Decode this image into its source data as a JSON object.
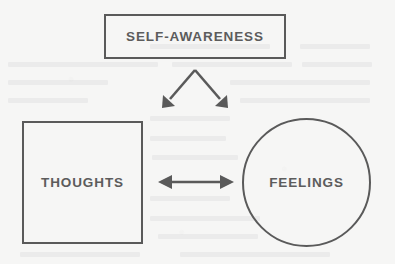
{
  "diagram": {
    "background_color": "#f6f6f5",
    "ink_color": "#5a5a5a",
    "text_color": "#5c5c5c",
    "nodes": [
      {
        "id": "self-awareness",
        "label": "SELF-AWARENESS",
        "shape": "rectangle"
      },
      {
        "id": "thoughts",
        "label": "THOUGHTS",
        "shape": "square"
      },
      {
        "id": "feelings",
        "label": "FEELINGS",
        "shape": "circle"
      }
    ],
    "connectors": [
      {
        "id": "branch-arrow",
        "from": "self-awareness",
        "to": [
          "thoughts",
          "feelings"
        ],
        "style": "inverted-v-double-head",
        "direction": "downward-both"
      },
      {
        "id": "bidirectional-arrow",
        "from": "thoughts",
        "to": "feelings",
        "style": "double-headed-line",
        "direction": "both"
      }
    ]
  }
}
